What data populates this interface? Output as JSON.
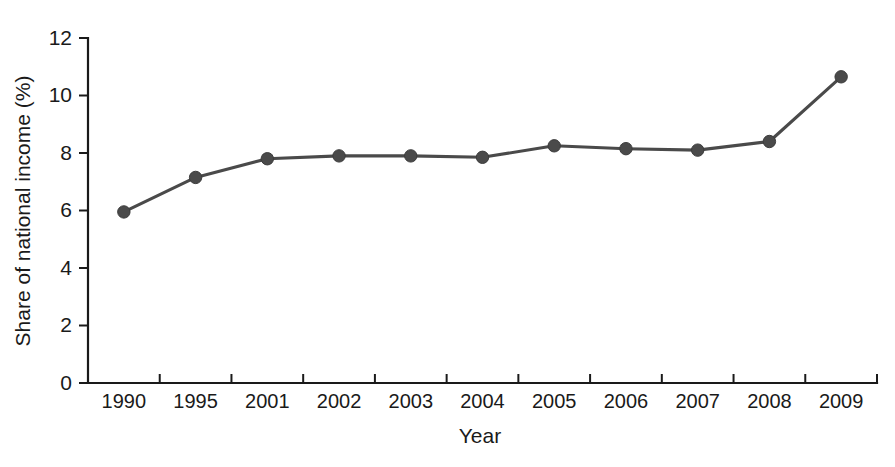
{
  "chart_data": {
    "type": "line",
    "title": "",
    "xlabel": "Year",
    "ylabel": "Share of national income (%)",
    "categories": [
      "1990",
      "1995",
      "2001",
      "2002",
      "2003",
      "2004",
      "2005",
      "2006",
      "2007",
      "2008",
      "2009"
    ],
    "values": [
      5.95,
      7.15,
      7.8,
      7.9,
      7.9,
      7.85,
      8.25,
      8.15,
      8.1,
      8.4,
      10.65
    ],
    "series": [
      {
        "name": "Share of national income",
        "values": [
          5.95,
          7.15,
          7.8,
          7.9,
          7.9,
          7.85,
          8.25,
          8.15,
          8.1,
          8.4,
          10.65
        ]
      }
    ],
    "ylim": [
      0,
      12
    ],
    "yticks": [
      0,
      2,
      4,
      6,
      8,
      10,
      12
    ],
    "ytick_labels": [
      "0",
      "2",
      "4",
      "6",
      "8",
      "10",
      "12"
    ],
    "grid": false,
    "legend": false,
    "legend_position": "none",
    "marker": "circle",
    "line_color": "#4a4a4a",
    "marker_color": "#4a4a4a",
    "axis_color": "#1a1a1a",
    "background_color": "#ffffff"
  }
}
